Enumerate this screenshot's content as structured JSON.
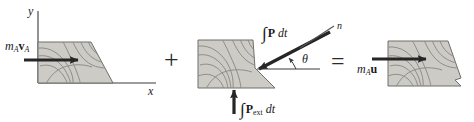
{
  "figure": {
    "kind": "impulse-momentum-diagram",
    "caption_equation": "m_A v_A + ∫P dt + ∫P_ext dt = m_A u",
    "fill_color": "#cccbc6",
    "contour_color": "#8e8d88",
    "outline_color": "#6f6e6a",
    "arrow_color": "#262626",
    "axis_color": "#3a3a3a",
    "text_color": "#1a1a1a"
  },
  "axes": {
    "y_label": "y",
    "x_label": "x"
  },
  "terms": {
    "left_momentum": {
      "m": "m",
      "m_sub": "A",
      "v": "v",
      "v_sub": "A"
    },
    "impulse_contact": {
      "integral": "∫",
      "force": "P",
      "dt": "dt"
    },
    "impulse_external": {
      "integral": "∫",
      "force": "P",
      "force_sub": "ext",
      "dt": "dt"
    },
    "right_momentum": {
      "m": "m",
      "m_sub": "A",
      "u": "u"
    },
    "normal": "n",
    "angle": "θ",
    "plus": "+",
    "equals": "="
  }
}
